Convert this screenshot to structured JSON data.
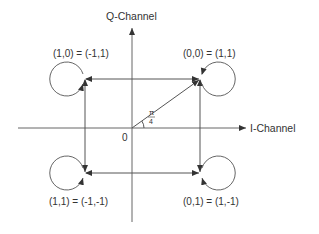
{
  "diagram": {
    "type": "QPSK constellation diagram",
    "axes": {
      "q_label": "Q-Channel",
      "i_label": "I-Channel",
      "origin_label": "0"
    },
    "angle": {
      "numerator": "π",
      "denominator": "4"
    },
    "points": [
      {
        "id": "top-left",
        "label": "(1,0) = (-1,1)"
      },
      {
        "id": "top-right",
        "label": "(0,0) = (1,1)"
      },
      {
        "id": "bottom-left",
        "label": "(1,1) = (-1,-1)"
      },
      {
        "id": "bottom-right",
        "label": "(0,1) = (1,-1)"
      }
    ],
    "colors": {
      "line": "#555555",
      "text": "#333333",
      "background": "#ffffff"
    }
  }
}
